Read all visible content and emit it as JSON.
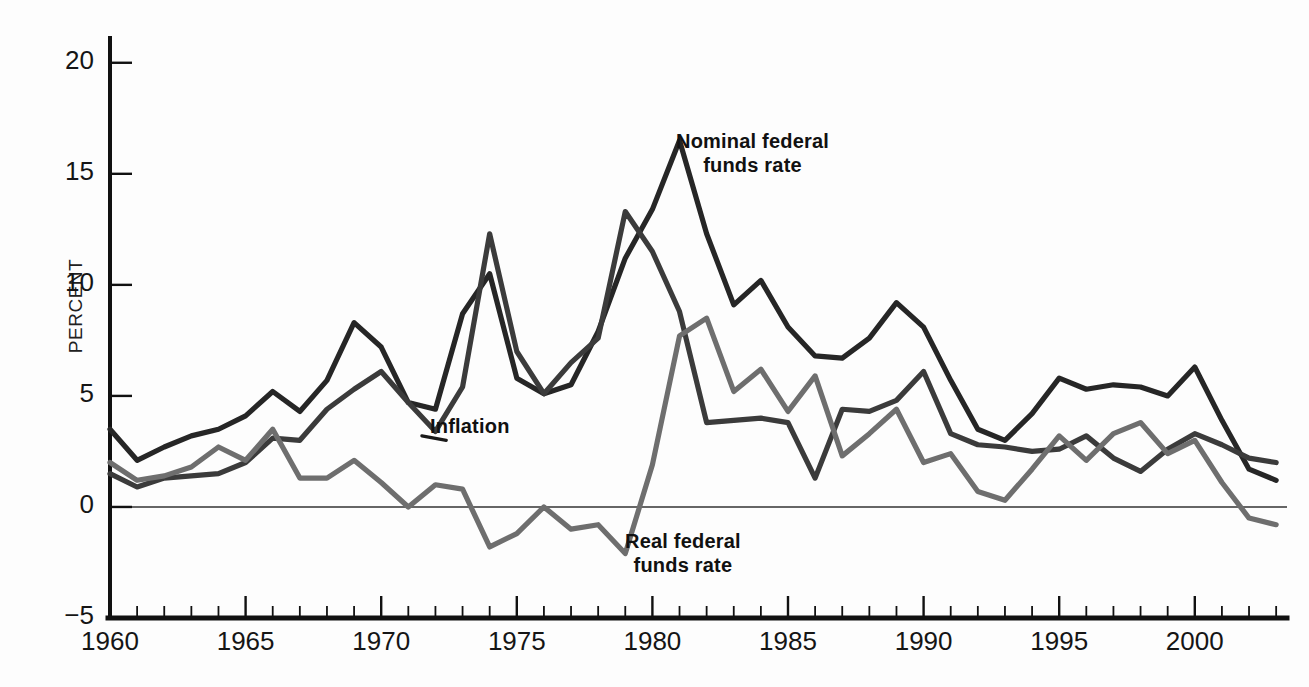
{
  "figure": {
    "background": "#fdfdfd",
    "ylabel": "PERCENT",
    "caption": ""
  },
  "colors": {
    "nominal": "#262626",
    "inflation": "#3b3b3b",
    "real": "#6e6e6e",
    "axis": "#111111",
    "zero_line": "#333333",
    "text": "#151515"
  },
  "labels": {
    "nominal_line1": "Nominal federal",
    "nominal_line2": "funds rate",
    "inflation": "Inflation",
    "real_line1": "Real federal",
    "real_line2": "funds rate"
  },
  "axes": {
    "y_ticks": [
      20,
      15,
      10,
      5,
      0,
      -5
    ],
    "y_tick_labels": [
      "20",
      "15",
      "10",
      "5",
      "0",
      "−5"
    ],
    "x_ticks": [
      1960,
      1965,
      1970,
      1975,
      1980,
      1985,
      1990,
      1995,
      2000
    ],
    "x_tick_labels": [
      "1960",
      "1965",
      "1970",
      "1975",
      "1980",
      "1985",
      "1990",
      "1995",
      "2000"
    ],
    "xlim": [
      1960,
      2003.4
    ],
    "ylim": [
      -5,
      20.8
    ],
    "minor_x_step": 1,
    "grid": false,
    "zero_line": true
  },
  "chart_data": {
    "type": "line",
    "title": "",
    "subtitle": "",
    "xlabel": "",
    "ylabel": "PERCENT",
    "xlim": [
      1960,
      2003.4
    ],
    "ylim": [
      -5,
      20.8
    ],
    "grid": false,
    "legend": "inline-annotations",
    "x": [
      1960,
      1961,
      1962,
      1963,
      1964,
      1965,
      1966,
      1967,
      1968,
      1969,
      1970,
      1971,
      1972,
      1973,
      1974,
      1975,
      1976,
      1977,
      1978,
      1979,
      1980,
      1981,
      1982,
      1983,
      1984,
      1985,
      1986,
      1987,
      1988,
      1989,
      1990,
      1991,
      1992,
      1993,
      1994,
      1995,
      1996,
      1997,
      1998,
      1999,
      2000,
      2001,
      2002,
      2003
    ],
    "series": [
      {
        "name": "Nominal federal funds rate",
        "color": "#262626",
        "values": [
          3.5,
          2.1,
          2.7,
          3.2,
          3.5,
          4.1,
          5.2,
          4.3,
          5.7,
          8.3,
          7.2,
          4.7,
          4.4,
          8.7,
          10.5,
          5.8,
          5.1,
          5.5,
          7.9,
          11.2,
          13.4,
          16.5,
          12.3,
          9.1,
          10.2,
          8.1,
          6.8,
          6.7,
          7.6,
          9.2,
          8.1,
          5.7,
          3.5,
          3.0,
          4.2,
          5.8,
          5.3,
          5.5,
          5.4,
          5.0,
          6.3,
          3.9,
          1.7,
          1.2
        ]
      },
      {
        "name": "Inflation",
        "color": "#3b3b3b",
        "values": [
          1.5,
          0.9,
          1.3,
          1.4,
          1.5,
          2.0,
          3.1,
          3.0,
          4.4,
          5.3,
          6.1,
          4.7,
          3.4,
          5.4,
          12.3,
          7.0,
          5.1,
          6.5,
          7.6,
          13.3,
          11.5,
          8.8,
          3.8,
          3.9,
          4.0,
          3.8,
          1.3,
          4.4,
          4.3,
          4.8,
          6.1,
          3.3,
          2.8,
          2.7,
          2.5,
          2.6,
          3.2,
          2.2,
          1.6,
          2.6,
          3.3,
          2.8,
          2.2,
          2.0
        ]
      },
      {
        "name": "Real federal funds rate",
        "color": "#6e6e6e",
        "values": [
          2.0,
          1.2,
          1.4,
          1.8,
          2.7,
          2.1,
          3.5,
          1.3,
          1.3,
          2.1,
          1.1,
          0.0,
          1.0,
          0.8,
          -1.8,
          -1.2,
          0.0,
          -1.0,
          -0.8,
          -2.1,
          1.9,
          7.7,
          8.5,
          5.2,
          6.2,
          4.3,
          5.9,
          2.3,
          3.3,
          4.4,
          2.0,
          2.4,
          0.7,
          0.3,
          1.7,
          3.2,
          2.1,
          3.3,
          3.8,
          2.4,
          3.0,
          1.1,
          -0.5,
          -0.8
        ]
      }
    ]
  }
}
